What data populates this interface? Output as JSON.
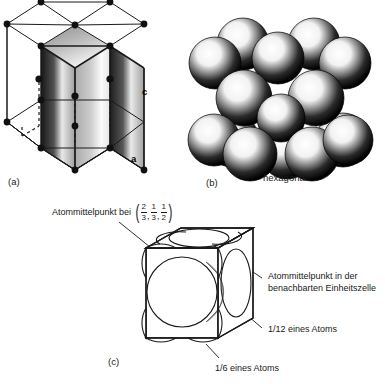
{
  "figure": {
    "panels": [
      {
        "tag": "(a)",
        "name": "hexagonal-prism-lattice"
      },
      {
        "tag": "(b)",
        "name": "hard-sphere-packing",
        "caption": "hexagonal"
      },
      {
        "tag": "(c)",
        "name": "rhombic-unit-cell"
      }
    ]
  },
  "panel_a": {
    "tag": "(a)",
    "axis_c": "c",
    "axis_a": "a",
    "vertex_atom_count": 12,
    "interior_atom_count": 3
  },
  "panel_b": {
    "tag": "(b)",
    "caption": "hexagonal",
    "sphere_count": 15
  },
  "panel_c": {
    "tag": "(c)",
    "label_center": {
      "text": "Atommittelpunkt bei",
      "fraction": {
        "values": [
          {
            "num": "2",
            "den": "3"
          },
          {
            "num": "1",
            "den": "3"
          },
          {
            "num": "1",
            "den": "2"
          }
        ],
        "separator": ","
      }
    },
    "label_neighbor": "Atommittelpunkt in der\nbenachbarten Einheitszelle",
    "label_twelfth": "1/12 eines Atoms",
    "label_sixth": "1/6 eines Atoms"
  },
  "colors": {
    "ink": "#1a1a1a",
    "fill_dark": "#141414",
    "paper": "#ffffff"
  }
}
